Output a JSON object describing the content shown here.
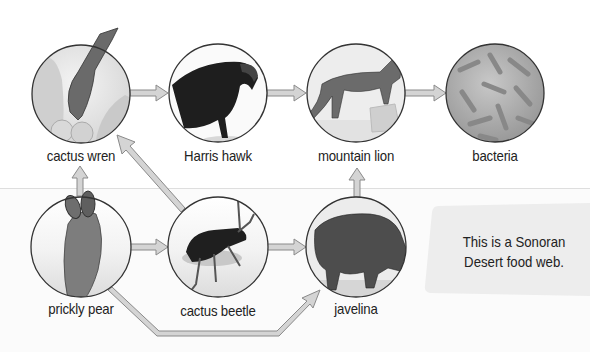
{
  "diagram": {
    "title": "Sonoran Desert food web",
    "nodes": [
      {
        "id": "cactus_wren",
        "label": "cactus wren",
        "cx": 81,
        "cy": 94
      },
      {
        "id": "harris_hawk",
        "label": "Harris hawk",
        "cx": 218,
        "cy": 93
      },
      {
        "id": "mountain_lion",
        "label": "mountain lion",
        "cx": 356,
        "cy": 93
      },
      {
        "id": "bacteria",
        "label": "bacteria",
        "cx": 495,
        "cy": 93
      },
      {
        "id": "prickly_pear",
        "label": "prickly pear",
        "cx": 81,
        "cy": 247
      },
      {
        "id": "cactus_beetle",
        "label": "cactus beetle",
        "cx": 218,
        "cy": 247
      },
      {
        "id": "javelina",
        "label": "javelina",
        "cx": 356,
        "cy": 247
      }
    ],
    "edges": [
      {
        "from": "cactus_wren",
        "to": "harris_hawk"
      },
      {
        "from": "harris_hawk",
        "to": "mountain_lion"
      },
      {
        "from": "mountain_lion",
        "to": "bacteria"
      },
      {
        "from": "prickly_pear",
        "to": "cactus_wren"
      },
      {
        "from": "prickly_pear",
        "to": "cactus_beetle"
      },
      {
        "from": "cactus_beetle",
        "to": "cactus_wren"
      },
      {
        "from": "cactus_beetle",
        "to": "javelina"
      },
      {
        "from": "prickly_pear",
        "to": "javelina"
      },
      {
        "from": "javelina",
        "to": "mountain_lion"
      }
    ],
    "callout": {
      "line1": "This is a Sonoran",
      "line2": "Desert food web."
    },
    "colors": {
      "arrow_fill": "#d4d4d4",
      "arrow_stroke": "#8a8a8a",
      "circle_stroke": "#333333",
      "callout_bg": "#eeeeee"
    }
  }
}
